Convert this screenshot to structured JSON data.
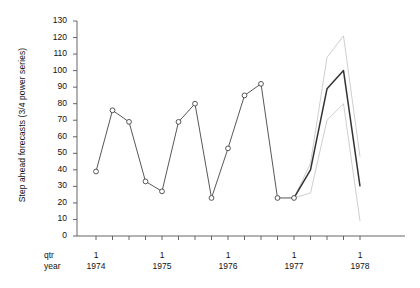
{
  "chart_data": {
    "type": "line",
    "title": "",
    "xlabel": "",
    "ylabel": "Step ahead forecasts (3/4 power series)",
    "ylim": [
      0,
      130
    ],
    "ytick_step": 10,
    "yticks": [
      0,
      10,
      20,
      30,
      40,
      50,
      60,
      70,
      80,
      90,
      100,
      110,
      120,
      130
    ],
    "grid": false,
    "legend": "none",
    "axis_corner_labels": [
      "qtr",
      "year"
    ],
    "x_quarter_tick_label": "1",
    "x_year_labels": [
      "1974",
      "1975",
      "1976",
      "1977",
      "1978"
    ],
    "x_quarters": [
      "1974 Q1",
      "1974 Q2",
      "1974 Q3",
      "1974 Q4",
      "1975 Q1",
      "1975 Q2",
      "1975 Q3",
      "1975 Q4",
      "1976 Q1",
      "1976 Q2",
      "1976 Q3",
      "1976 Q4",
      "1977 Q1",
      "1977 Q2",
      "1977 Q3",
      "1977 Q4",
      "1978 Q1"
    ],
    "series": [
      {
        "name": "observed",
        "style": "solid-with-open-circle-markers",
        "color": "#444444",
        "x": [
          "1974 Q1",
          "1974 Q2",
          "1974 Q3",
          "1974 Q4",
          "1975 Q1",
          "1975 Q2",
          "1975 Q3",
          "1975 Q4",
          "1976 Q1",
          "1976 Q2",
          "1976 Q3",
          "1976 Q4",
          "1977 Q1"
        ],
        "values": [
          39,
          76,
          69,
          33,
          27,
          69,
          80,
          23,
          53,
          85,
          92,
          23,
          23
        ]
      },
      {
        "name": "forecast",
        "style": "solid-bold-no-markers",
        "color": "#333333",
        "x": [
          "1977 Q1",
          "1977 Q2",
          "1977 Q3",
          "1977 Q4",
          "1978 Q1"
        ],
        "values": [
          23,
          40,
          89,
          100,
          30
        ]
      },
      {
        "name": "forecast-upper",
        "style": "thin-light",
        "color": "#b9b9b9",
        "x": [
          "1977 Q1",
          "1977 Q2",
          "1977 Q3",
          "1977 Q4",
          "1978 Q1"
        ],
        "values": [
          23,
          44,
          108,
          121,
          48
        ]
      },
      {
        "name": "forecast-lower",
        "style": "thin-light",
        "color": "#b9b9b9",
        "x": [
          "1977 Q1",
          "1977 Q2",
          "1977 Q3",
          "1977 Q4",
          "1978 Q1"
        ],
        "values": [
          23,
          26,
          70,
          80,
          9
        ]
      }
    ]
  }
}
